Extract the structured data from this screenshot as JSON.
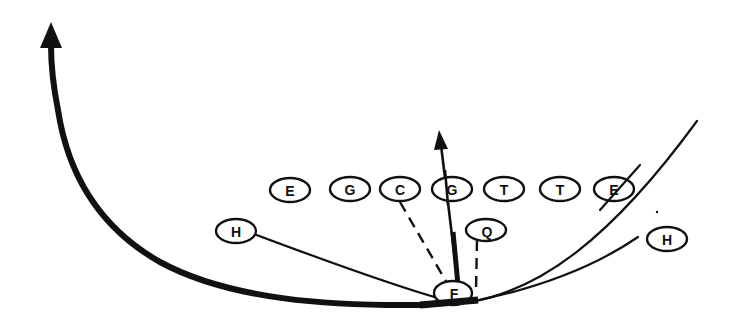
{
  "diagram": {
    "type": "football-play",
    "background": "#ffffff",
    "ink_color": "#111111",
    "offensive_line": [
      {
        "id": "LE",
        "label": "E",
        "cx": 290,
        "cy": 190
      },
      {
        "id": "LG",
        "label": "G",
        "cx": 350,
        "cy": 189
      },
      {
        "id": "C",
        "label": "C",
        "cx": 400,
        "cy": 189
      },
      {
        "id": "RG",
        "label": "G",
        "cx": 452,
        "cy": 189
      },
      {
        "id": "RT1",
        "label": "T",
        "cx": 504,
        "cy": 189
      },
      {
        "id": "RT2",
        "label": "T",
        "cx": 560,
        "cy": 189
      },
      {
        "id": "RE",
        "label": "E",
        "cx": 614,
        "cy": 189
      }
    ],
    "backs": [
      {
        "id": "LH",
        "label": "H",
        "cx": 236,
        "cy": 231
      },
      {
        "id": "QB",
        "label": "Q",
        "cx": 486,
        "cy": 230
      },
      {
        "id": "FB",
        "label": "F",
        "cx": 453,
        "cy": 293
      },
      {
        "id": "RH",
        "label": "H",
        "cx": 667,
        "cy": 239
      }
    ],
    "routes": [
      {
        "name": "fullback-sweep-left",
        "style": "thick-arrow"
      },
      {
        "name": "guard-block-upfield",
        "style": "thin-arrow"
      },
      {
        "name": "left-halfback-motion",
        "style": "thin"
      },
      {
        "name": "right-end-route",
        "style": "thin"
      },
      {
        "name": "right-halfback-motion",
        "style": "thin"
      },
      {
        "name": "center-dashed-path",
        "style": "dashed"
      },
      {
        "name": "quarterback-dashed-path",
        "style": "dashed"
      }
    ]
  }
}
